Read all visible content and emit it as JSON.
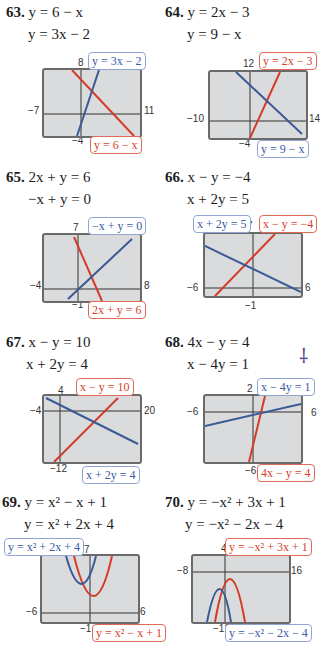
{
  "problems": [
    {
      "number": "63.",
      "eq1": "y = 6 − x",
      "eq2": "y = 3x − 2",
      "window": {
        "xmin": "−7",
        "xmax": "11",
        "ymin": "−4",
        "ymax": "8"
      },
      "labels": {
        "blue": "y = 3x − 2",
        "red": "y = 6 − x"
      }
    },
    {
      "number": "64.",
      "eq1": "y = 2x − 3",
      "eq2": "y = 9 − x",
      "window": {
        "xmin": "−10",
        "xmax": "14",
        "ymin": "−4",
        "ymax": "12"
      },
      "labels": {
        "red": "y = 2x − 3",
        "blue": "y = 9 − x"
      }
    },
    {
      "number": "65.",
      "eq1": "2x + y = 6",
      "eq2": "−x + y = 0",
      "window": {
        "xmin": "−4",
        "xmax": "8",
        "ymin": "−1",
        "ymax": "7"
      },
      "labels": {
        "blue": "−x + y = 0",
        "red": "2x + y = 6"
      }
    },
    {
      "number": "66.",
      "eq1": "x − y = −4",
      "eq2": "x + 2y = 5",
      "window": {
        "xmin": "−6",
        "xmax": "6",
        "ymin": "−1",
        "ymax": "7"
      },
      "labels": {
        "blue": "x + 2y = 5",
        "red": "x − y = −4"
      }
    },
    {
      "number": "67.",
      "eq1": "x − y = 10",
      "eq2": "x + 2y = 4",
      "window": {
        "xmin": "−4",
        "xmax": "20",
        "ymin": "−12",
        "ymax": "4"
      },
      "labels": {
        "red": "x − y = 10",
        "blue": "x + 2y = 4"
      }
    },
    {
      "number": "68.",
      "eq1": "4x − y = 4",
      "eq2": "x − 4y = 1",
      "window": {
        "xmin": "−6",
        "xmax": "6",
        "ymin": "−6",
        "ymax": "2"
      },
      "labels": {
        "blue": "x − 4y = 1",
        "red": "4x − y = 4"
      }
    },
    {
      "number": "69.",
      "eq1": "y = x² − x + 1",
      "eq2": "y = x² + 2x + 4",
      "window": {
        "xmin": "−6",
        "xmax": "6",
        "ymin": "−1",
        "ymax": "7"
      },
      "labels": {
        "blue": "y = x² + 2x + 4",
        "red": "y = x² − x + 1"
      }
    },
    {
      "number": "70.",
      "eq1": "y = −x² + 3x + 1",
      "eq2": "y = −x² − 2x − 4",
      "window": {
        "xmin": "−8",
        "xmax": "16",
        "ymin": "−12",
        "ymax": "4"
      },
      "labels": {
        "red": "y = −x² + 3x + 1",
        "blue": "y = −x² − 2x − 4"
      }
    }
  ],
  "colors": {
    "red": "#d8402c",
    "blue": "#3b5aa6",
    "screen": "#dadbdc",
    "frame": "#6a6a6a"
  }
}
